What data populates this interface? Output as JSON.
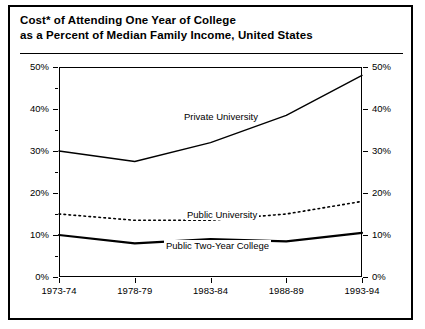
{
  "title": {
    "line1": "Cost* of Attending One Year of College",
    "line2": "as a Percent of Median Family Income, United States"
  },
  "axis": {
    "y_left_ticks": [
      "0%",
      "10%",
      "20%",
      "30%",
      "40%",
      "50%"
    ],
    "y_right_ticks": [
      "0%",
      "10%",
      "20%",
      "30%",
      "40%",
      "50%"
    ],
    "x_ticks": [
      "1973-74",
      "1978-79",
      "1983-84",
      "1988-89",
      "1993-94"
    ]
  },
  "series_labels": {
    "private": "Private University",
    "public": "Public University",
    "twoyear": "Public Two-Year College"
  },
  "colors": {
    "line": "#000000",
    "frame": "#000000",
    "background": "#ffffff"
  },
  "chart_data": {
    "type": "line",
    "title": "Cost* of Attending One Year of College as a Percent of Median Family Income, United States",
    "xlabel": "",
    "ylabel": "",
    "categories": [
      "1973-74",
      "1978-79",
      "1983-84",
      "1988-89",
      "1993-94"
    ],
    "ylim": [
      0,
      50
    ],
    "ytick_values": [
      0,
      10,
      20,
      30,
      40,
      50
    ],
    "ytick_labels": [
      "0%",
      "10%",
      "20%",
      "30%",
      "40%",
      "50%"
    ],
    "grid": false,
    "legend": "inline-annotations",
    "series": [
      {
        "name": "Private University",
        "values": [
          30,
          27.5,
          32,
          38.5,
          48
        ],
        "style": "solid",
        "width": 1.4
      },
      {
        "name": "Public University",
        "values": [
          15,
          13.5,
          13.5,
          15,
          18
        ],
        "style": "dotted",
        "width": 1.6
      },
      {
        "name": "Public Two-Year College",
        "values": [
          10,
          8,
          9,
          8.5,
          10.5
        ],
        "style": "solid",
        "width": 2.2
      }
    ]
  }
}
